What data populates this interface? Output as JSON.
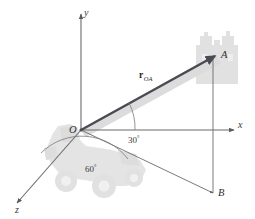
{
  "figure": {
    "caption": "",
    "background_color": "#ffffff"
  },
  "axes": {
    "x_label": "x",
    "y_label": "y",
    "z_label": "z",
    "line_color": "#6b6b6b"
  },
  "points": {
    "origin_label": "O",
    "a_label": "A",
    "b_label": "B"
  },
  "vector": {
    "symbol": "r",
    "subscript": "OA",
    "color": "#4a4a52",
    "shadow_color": "#d8d8d8"
  },
  "angles": {
    "from_x_axis": "30",
    "from_x_axis_unit": "°",
    "from_z_axis": "60",
    "from_z_axis_unit": "°",
    "arc_color": "#7a7a7a"
  },
  "silhouettes": {
    "crane_label": "crane-silhouette",
    "building_label": "building-silhouette",
    "fill": "#dcdcdc"
  }
}
